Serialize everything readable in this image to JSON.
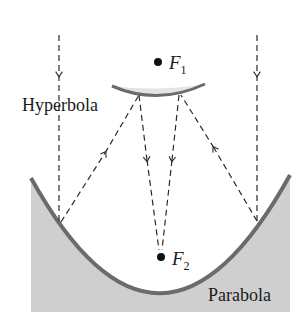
{
  "diagram": {
    "labels": {
      "hyperbola": "Hyperbola",
      "parabola": "Parabola",
      "focus1": "F",
      "focus1_sub": "1",
      "focus2": "F",
      "focus2_sub": "2"
    },
    "colors": {
      "curve": "#6b6b6b",
      "fill": "#cfcfcf",
      "hyperbola_fill": "#e4e4e4",
      "ray": "#2a2a2a"
    }
  }
}
